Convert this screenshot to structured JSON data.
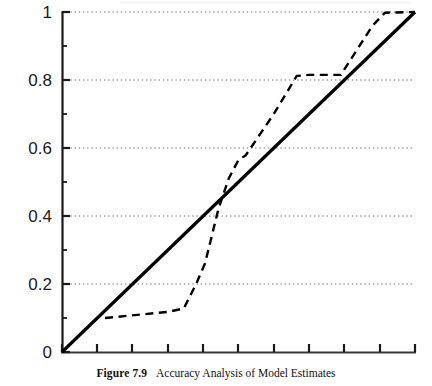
{
  "figure": {
    "caption_number": "Figure 7.9",
    "caption_text": "Accuracy Analysis of Model Estimates"
  },
  "chart_data": {
    "type": "line",
    "title": "Accuracy Analysis of Model Estimates",
    "xlabel": "",
    "ylabel": "",
    "xlim": [
      0,
      1
    ],
    "ylim": [
      0,
      1
    ],
    "grid": true,
    "grid_orientation": "horizontal",
    "grid_style": "dotted",
    "legend": "none",
    "y_ticks": [
      0,
      0.2,
      0.4,
      0.6,
      0.8,
      1
    ],
    "y_tick_labels": [
      "0",
      "0.2",
      "0.4",
      "0.6",
      "0.8",
      "1"
    ],
    "y_minor_ticks": [
      0.1,
      0.3,
      0.5,
      0.7,
      0.9
    ],
    "x_ticks": [
      0,
      0.1,
      0.2,
      0.3,
      0.4,
      0.5,
      0.6,
      0.7,
      0.8,
      0.9,
      1
    ],
    "x_tick_labels": [
      "",
      "",
      "",
      "",
      "",
      "",
      "",
      "",
      "",
      "",
      ""
    ],
    "series": [
      {
        "name": "reference-diagonal",
        "style": "solid",
        "color": "#000000",
        "width": 3,
        "x": [
          0,
          1
        ],
        "y": [
          0,
          1
        ]
      },
      {
        "name": "model-estimate-curve",
        "style": "dashed",
        "color": "#000000",
        "width": 2,
        "x": [
          0.122,
          0.3,
          0.345,
          0.38,
          0.405,
          0.443,
          0.472,
          0.5,
          0.52,
          0.6,
          0.665,
          0.7,
          0.79,
          0.83,
          0.88,
          0.915,
          1.0
        ],
        "y": [
          0.1,
          0.118,
          0.128,
          0.2,
          0.26,
          0.42,
          0.51,
          0.565,
          0.578,
          0.7,
          0.812,
          0.815,
          0.815,
          0.88,
          0.96,
          0.998,
          1.0
        ]
      }
    ]
  }
}
